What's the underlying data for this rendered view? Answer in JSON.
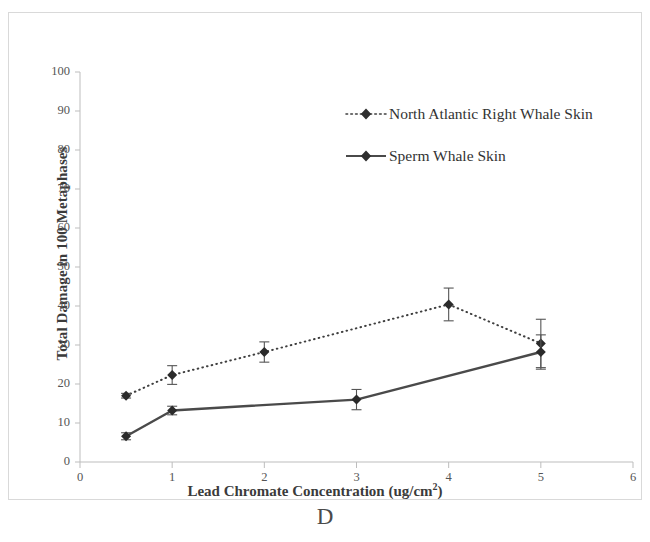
{
  "panel": {
    "letter": "D"
  },
  "chart_data": {
    "type": "line",
    "title": "",
    "xlabel": "Lead Chromate Concentration (ug/cm2)",
    "xlabel_base": "Lead Chromate Concentration (ug/cm",
    "xlabel_sup": "2",
    "xlabel_tail": ")",
    "ylabel": "Total Damage in 100 Metaphases",
    "xlim": [
      0,
      6
    ],
    "ylim": [
      0,
      100
    ],
    "xticks": [
      0,
      1,
      2,
      3,
      4,
      5,
      6
    ],
    "xtick_labels": [
      "0",
      "1",
      "2",
      "3",
      "4",
      "5",
      "6"
    ],
    "yticks": [
      0,
      10,
      20,
      30,
      40,
      50,
      60,
      70,
      80,
      90,
      100
    ],
    "ytick_labels": [
      "0",
      "10",
      "20",
      "30",
      "40",
      "50",
      "60",
      "70",
      "80",
      "90",
      "100"
    ],
    "grid": false,
    "legend_position": "upper right",
    "error_bars": true,
    "series": [
      {
        "name": "North Atlantic Right Whale Skin",
        "style": "dotted",
        "marker": "diamond",
        "color": "#3f3f3f",
        "x": [
          0.5,
          1,
          2,
          4,
          5
        ],
        "values": [
          17,
          22.3,
          28.2,
          40.4,
          30.4
        ],
        "errors": [
          0.6,
          2.4,
          2.6,
          4.2,
          6.2
        ]
      },
      {
        "name": "Sperm Whale Skin",
        "style": "solid",
        "marker": "diamond",
        "color": "#4a4a4a",
        "x": [
          0.5,
          1,
          3,
          5
        ],
        "values": [
          6.6,
          13.2,
          16,
          28.2
        ],
        "errors": [
          0.9,
          1.1,
          2.6,
          4.4
        ]
      }
    ]
  },
  "legend": {
    "items": [
      {
        "label": "North Atlantic Right Whale Skin",
        "style": "dotted"
      },
      {
        "label": "Sperm Whale Skin",
        "style": "solid"
      }
    ]
  }
}
